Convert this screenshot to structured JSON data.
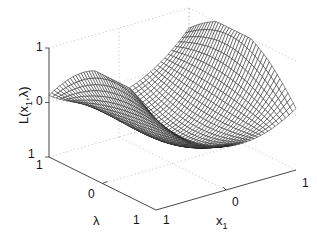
{
  "chart_data": {
    "type": "surface-mesh",
    "title": "",
    "xlabel": "x1",
    "ylabel": "λ",
    "zlabel": "L(x1,λ)",
    "x_range": [
      -1,
      1
    ],
    "y_range": [
      -1,
      1
    ],
    "z_range": [
      -1,
      1
    ],
    "x_ticks": [
      "0",
      "1"
    ],
    "y_ticks": [
      "0",
      "1"
    ],
    "z_ticks": [
      "1",
      "0",
      "1"
    ],
    "grid": true,
    "grid_style": "dotted",
    "mesh_color": "#1a1a1a",
    "mesh_resolution": 40,
    "function_description": "saddle-shaped surface with humps at x1 = ±1 and a dip at center"
  },
  "labels": {
    "zaxis": {
      "main": "L(x",
      "sub": "1",
      "tail": ",λ)"
    },
    "xaxis": {
      "main": "x",
      "sub": "1"
    },
    "yaxis": {
      "main": "λ"
    },
    "ztick_top": "1",
    "ztick_mid": "0",
    "ztick_bottom": "1",
    "ytick_left": "1",
    "ytick_mid": "0",
    "ytick_right": "1",
    "xtick_left": "1",
    "xtick_mid": "0",
    "xtick_right": "1"
  },
  "colors": {
    "axis": "#333333",
    "grid": "#bbbbbb",
    "mesh": "#1a1a1a",
    "background": "#ffffff"
  }
}
